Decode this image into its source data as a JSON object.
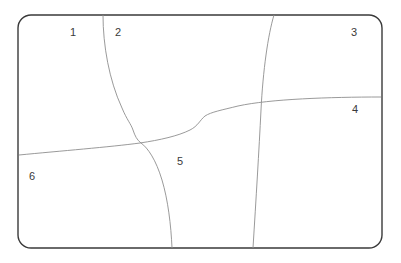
{
  "figure": {
    "type": "partition-diagram",
    "background_color": "#ffffff",
    "frame": {
      "name": "rounded-rectangle-border",
      "x": 18,
      "y": 15,
      "width": 364,
      "height": 233,
      "corner_radius": 13,
      "stroke_color": "#3a3a3a",
      "stroke_width": 1.4
    },
    "curve_style": {
      "stroke_color": "#8e8e8e",
      "stroke_width": 0.9,
      "fill": "none"
    },
    "curves": [
      {
        "name": "curve-upper-vertical-left",
        "path": "M 103 15 C 103 45 109 80 122 108 C 127 120 131 124 133 130 C 135 136 137 140 141 143 C 148 148 156 160 162 180 C 168 200 171 225 172 248"
      },
      {
        "name": "curve-upper-vertical-right",
        "path": "M 274 15 C 268 35 263 70 261 110 C 259 150 256 200 253 248"
      },
      {
        "name": "curve-horizontal-main",
        "path": "M 19 155 C 60 151 110 147 140 143 C 160 140 178 136 190 130 C 198 126 200 120 205 116 C 211 112 222 110 238 106 C 270 99 330 97 381 97"
      }
    ],
    "labels": [
      {
        "name": "region-label-1",
        "text": "1",
        "x": 70,
        "y": 27
      },
      {
        "name": "region-label-2",
        "text": "2",
        "x": 115,
        "y": 27
      },
      {
        "name": "region-label-3",
        "text": "3",
        "x": 351,
        "y": 27
      },
      {
        "name": "region-label-4",
        "text": "4",
        "x": 352,
        "y": 104
      },
      {
        "name": "region-label-5",
        "text": "5",
        "x": 177,
        "y": 156
      },
      {
        "name": "region-label-6",
        "text": "6",
        "x": 29,
        "y": 171
      }
    ]
  }
}
